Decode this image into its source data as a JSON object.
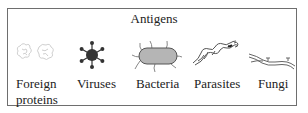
{
  "title": "Antigens",
  "items": [
    {
      "label_line1": "Foreign",
      "label_line2": "proteins",
      "icon": "foreign-proteins-icon"
    },
    {
      "label_line1": "Viruses",
      "icon": "virus-icon"
    },
    {
      "label_line1": "Bacteria",
      "icon": "bacterium-icon"
    },
    {
      "label_line1": "Parasites",
      "icon": "parasite-icon"
    },
    {
      "label_line1": "Fungi",
      "icon": "fungus-icon"
    }
  ],
  "colors": {
    "border": "#6e6e6e",
    "text": "#222222",
    "virus_fill": "#333333",
    "bacteria_fill": "#b5b5b5",
    "protein_stroke": "#cfcfcf"
  }
}
